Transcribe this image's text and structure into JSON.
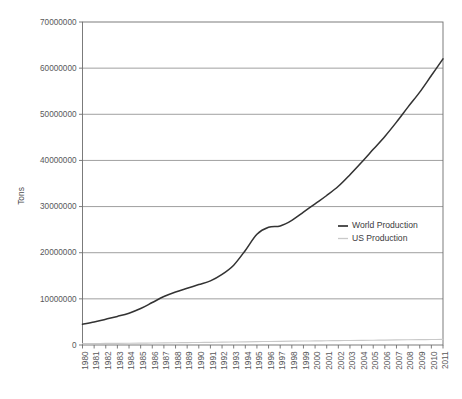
{
  "chart_data": {
    "type": "line",
    "title": "",
    "xlabel": "",
    "ylabel": "Tons",
    "ylim": [
      0,
      70000000
    ],
    "ytick_values": [
      0,
      10000000,
      20000000,
      30000000,
      40000000,
      50000000,
      60000000,
      70000000
    ],
    "ytick_labels": [
      "0",
      "10000000",
      "20000000",
      "30000000",
      "40000000",
      "50000000",
      "60000000",
      "70000000"
    ],
    "grid": true,
    "grid_axis": "y",
    "legend_position": "center-right",
    "x": [
      1980,
      1981,
      1982,
      1983,
      1984,
      1985,
      1986,
      1987,
      1988,
      1989,
      1990,
      1991,
      1992,
      1993,
      1994,
      1995,
      1996,
      1997,
      1998,
      1999,
      2000,
      2001,
      2002,
      2003,
      2004,
      2005,
      2006,
      2007,
      2008,
      2009,
      2010,
      2011
    ],
    "xtick_labels": [
      "1980",
      "1981",
      "1982",
      "1983",
      "1984",
      "1985",
      "1986",
      "1987",
      "1988",
      "1989",
      "1990",
      "1991",
      "1992",
      "1993",
      "1994",
      "1995",
      "1996",
      "1997",
      "1998",
      "1999",
      "2000",
      "2001",
      "2002",
      "2003",
      "2004",
      "2005",
      "2006",
      "2007",
      "2008",
      "2009",
      "2010",
      "2011"
    ],
    "series": [
      {
        "name": "World Production",
        "color": "#333333",
        "values": [
          4500000,
          5000000,
          5600000,
          6200000,
          6900000,
          7900000,
          9200000,
          10500000,
          11500000,
          12300000,
          13100000,
          13900000,
          15300000,
          17300000,
          20500000,
          24000000,
          25500000,
          25800000,
          27000000,
          28800000,
          30600000,
          32400000,
          34400000,
          36900000,
          39600000,
          42400000,
          45200000,
          48300000,
          51600000,
          54800000,
          58400000,
          62000000
        ]
      },
      {
        "name": "US Production",
        "color": "#c9c9c9",
        "values": [
          300000,
          320000,
          340000,
          360000,
          380000,
          400000,
          430000,
          460000,
          490000,
          520000,
          550000,
          580000,
          610000,
          650000,
          690000,
          730000,
          770000,
          800000,
          830000,
          860000,
          890000,
          920000,
          950000,
          980000,
          1010000,
          1040000,
          1070000,
          1100000,
          1130000,
          1160000,
          1190000,
          1220000
        ]
      }
    ]
  },
  "legend": {
    "items": [
      {
        "label": "World Production",
        "color": "#333333"
      },
      {
        "label": "US Production",
        "color": "#c9c9c9"
      }
    ]
  },
  "colors": {
    "world_production": "#333333",
    "us_production": "#c9c9c9",
    "gridline": "#959595",
    "axis": "#6e6e6e",
    "tick_text": "#58585a",
    "background": "#ffffff"
  }
}
